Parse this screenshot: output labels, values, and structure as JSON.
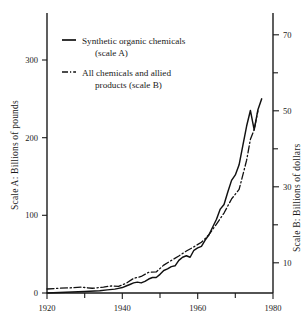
{
  "chart_data": {
    "type": "line",
    "title": "",
    "subtitle": "",
    "xlabel": "",
    "ylabel": "Scale A: Billions of pounds",
    "y2label": "Scale B: Billions of dollars",
    "xlim": [
      1920,
      1980
    ],
    "ylim": [
      0,
      360
    ],
    "y2lim": [
      0,
      77
    ],
    "grid": false,
    "legend_position": "upper-left-inside",
    "x_ticks_major": [
      1920,
      1940,
      1960,
      1980
    ],
    "x_ticks_minor": [
      1930,
      1950,
      1970
    ],
    "x_tick_labels": [
      "1920",
      "1940",
      "1960",
      "1980"
    ],
    "y_ticks_left": [
      0,
      100,
      200,
      300
    ],
    "y_tick_labels_left": [
      "0",
      "100",
      "200",
      "300"
    ],
    "y_ticks_right_labeled": [
      10,
      30,
      50,
      70
    ],
    "y_tick_labels_right": [
      "10",
      "30",
      "50",
      "70"
    ],
    "y_ticks_right_minor": [
      20,
      40,
      60
    ],
    "series": [
      {
        "name": "Synthetic organic chemicals  (scale A)",
        "axis": "A",
        "style": "solid",
        "units": "billions of pounds",
        "x": [
          1920,
          1925,
          1930,
          1934,
          1936,
          1938,
          1939,
          1940,
          1941,
          1942,
          1943,
          1944,
          1945,
          1946,
          1947,
          1948,
          1949,
          1950,
          1951,
          1952,
          1953,
          1954,
          1955,
          1956,
          1957,
          1958,
          1959,
          1960,
          1961,
          1962,
          1963,
          1964,
          1965,
          1966,
          1967,
          1968,
          1969,
          1970,
          1971,
          1972,
          1973,
          1974,
          1975,
          1976,
          1977
        ],
        "values": [
          0,
          1,
          2,
          3,
          4,
          5,
          6,
          7,
          9,
          11,
          13,
          14,
          13,
          15,
          18,
          20,
          20,
          24,
          29,
          31,
          34,
          35,
          42,
          46,
          48,
          46,
          55,
          58,
          60,
          68,
          75,
          85,
          95,
          108,
          114,
          130,
          145,
          152,
          165,
          190,
          215,
          235,
          210,
          236,
          250
        ]
      },
      {
        "name": "All chemicals and allied products  (scale B)",
        "axis": "B",
        "style": "dash-dot",
        "units": "billions of dollars",
        "x": [
          1920,
          1923,
          1926,
          1929,
          1932,
          1935,
          1937,
          1939,
          1941,
          1943,
          1945,
          1947,
          1949,
          1951,
          1953,
          1955,
          1957,
          1959,
          1961,
          1963,
          1965,
          1967,
          1969,
          1971,
          1973,
          1974,
          1975,
          1976
        ],
        "values": [
          3.1,
          3.3,
          3.4,
          3.6,
          3.3,
          3.6,
          3.9,
          3.8,
          4.6,
          5.9,
          6.4,
          7.5,
          7.6,
          9.4,
          10.6,
          11.8,
          13.1,
          14.2,
          15.4,
          17.4,
          20.2,
          23.1,
          26.8,
          29.3,
          37.0,
          42.5,
          45.0,
          50.0
        ]
      }
    ]
  },
  "legend": {
    "items": [
      {
        "label_line1": "Synthetic organic chemicals",
        "label_line2": "(scale A)",
        "marker": "solid-line-swatch"
      },
      {
        "label_line1": "All chemicals and allied",
        "label_line2": "products  (scale B)",
        "marker": "dash-dot-line-swatch"
      }
    ]
  },
  "axes": {
    "left_title": "Scale A: Billions of pounds",
    "right_title": "Scale B: Billions of dollars"
  },
  "colors": {
    "ink": "#111111",
    "background": "#ffffff"
  }
}
